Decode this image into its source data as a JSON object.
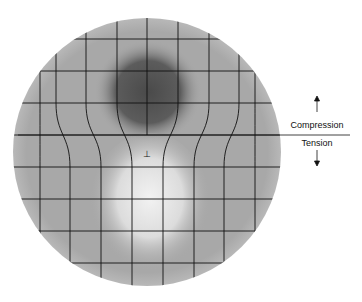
{
  "figure": {
    "labels": {
      "compression": "Compression",
      "tension": "Tension"
    },
    "dislocation_symbol": "⊥",
    "colors": {
      "disk": "#a9a9a9",
      "compression_shade": "#555555",
      "tension_shade": "#e6e6e6",
      "grid": "#111111",
      "background": "#ffffff"
    },
    "disk": {
      "cx": 147,
      "cy": 152,
      "r": 134
    },
    "grid": {
      "horizontal_lines_y": [
        39,
        71,
        103,
        135,
        167,
        199,
        231,
        263
      ],
      "top_columns_x": [
        56,
        86,
        117,
        147,
        178,
        209,
        239
      ],
      "bottom_columns_x": [
        40,
        70,
        101,
        132,
        163,
        194,
        224,
        255
      ],
      "extra_half_plane_x": 147,
      "slip_plane_y": 135
    },
    "divider": {
      "x1": 18,
      "x2": 350,
      "y": 135
    },
    "arrows": {
      "up": {
        "x": 317,
        "y1": 96,
        "y2": 112
      },
      "down": {
        "x": 317,
        "y1": 150,
        "y2": 166
      }
    }
  }
}
